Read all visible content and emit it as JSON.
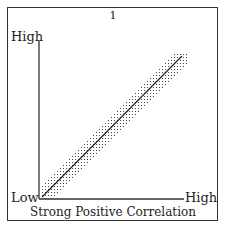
{
  "chart_data": {
    "type": "scatter",
    "title": "1",
    "caption": "Strong Positive Correlation",
    "xlabel_low": "Low",
    "xlabel_high": "High",
    "ylabel_high": "High",
    "trend": "strong positive linear",
    "trendline": {
      "x": [
        0,
        1
      ],
      "y": [
        0,
        1
      ]
    },
    "band_halfwidth": 0.08,
    "grid": false,
    "legend": null,
    "colors": {
      "ink": "#222222",
      "background": "#ffffff"
    }
  },
  "labels": {
    "number": "1",
    "y_high": "High",
    "x_low": "Low",
    "x_high": "High",
    "caption": "Strong Positive Correlation"
  }
}
